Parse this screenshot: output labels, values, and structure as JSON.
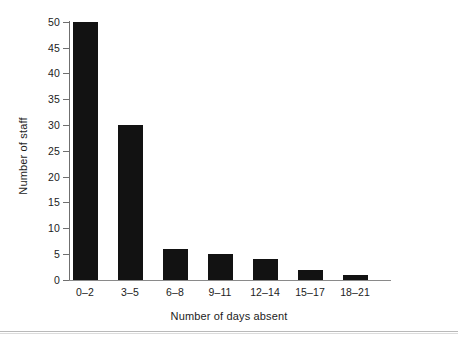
{
  "chart_data": {
    "type": "bar",
    "title": "",
    "xlabel": "Number of days absent",
    "ylabel": "Number of staff",
    "categories": [
      "0–2",
      "3–5",
      "6–8",
      "9–11",
      "12–14",
      "15–17",
      "18–21"
    ],
    "values": [
      50,
      30,
      6,
      5,
      4,
      2,
      1
    ],
    "ylim": [
      0,
      50
    ],
    "ytick_labels": [
      "0",
      "5",
      "10",
      "15",
      "20",
      "25",
      "30",
      "35",
      "40",
      "45",
      "50"
    ],
    "ytick_values": [
      0,
      5,
      10,
      15,
      20,
      25,
      30,
      35,
      40,
      45,
      50
    ],
    "ytick_step": 5,
    "grid": false,
    "legend": "none",
    "bar_color": "#121212",
    "axis_color": "#6f6f6f",
    "background": "#ffffff"
  }
}
